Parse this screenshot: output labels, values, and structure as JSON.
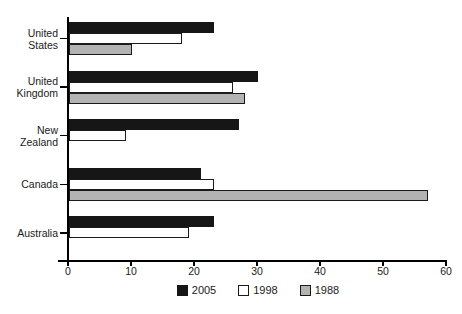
{
  "chart_data": {
    "type": "bar",
    "orientation": "horizontal",
    "title": "",
    "xlabel": "",
    "ylabel": "",
    "categories": [
      "United States",
      "United Kingdom",
      "New Zealand",
      "Canada",
      "Australia"
    ],
    "series": [
      {
        "name": "2005",
        "color": "#161616",
        "border_color": "#161616",
        "values": [
          23,
          30,
          27,
          21,
          23
        ]
      },
      {
        "name": "1998",
        "color": "#ffffff",
        "border_color": "#1a1a1a",
        "values": [
          18,
          26,
          9,
          23,
          19
        ]
      },
      {
        "name": "1988",
        "color": "#b3b3b3",
        "border_color": "#1a1a1a",
        "values": [
          10,
          28,
          null,
          57,
          null
        ]
      }
    ],
    "xlim": [
      0,
      60
    ],
    "x_ticks": [
      0,
      10,
      20,
      30,
      40,
      50,
      60
    ],
    "grid": false,
    "legend_position": "bottom",
    "axis_color": "#000000",
    "text_color": "#1a1a1a"
  }
}
